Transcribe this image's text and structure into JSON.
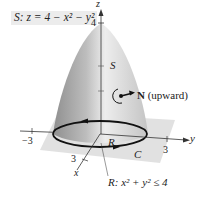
{
  "figure": {
    "surface_label": {
      "prefix": "S",
      "equation": "z = 4 − x² − y²"
    },
    "axes": {
      "z": {
        "label": "z",
        "tick": "4"
      },
      "y": {
        "label": "y",
        "tick": "3"
      },
      "x": {
        "label": "x",
        "tick": "3"
      },
      "neg": {
        "tick": "−3"
      }
    },
    "labels": {
      "surface": "S",
      "normal": "N",
      "normal_note": "(upward)",
      "region": "R",
      "curve": "C",
      "region_def_prefix": "R",
      "region_def": "x² + y² ≤ 4"
    },
    "colors": {
      "surface_light": "#e6e6e6",
      "surface_dark": "#9a9a9a",
      "plane": "#d9d9d9",
      "curve": "#111111",
      "axis": "#333333"
    }
  }
}
